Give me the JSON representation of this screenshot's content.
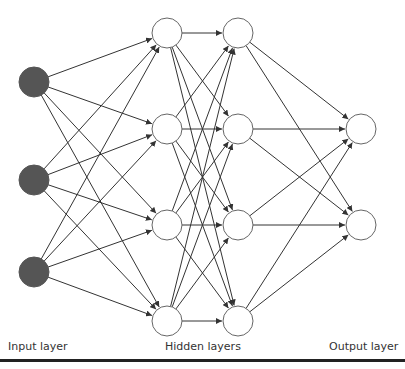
{
  "labels": {
    "input": "Input layer",
    "hidden": "Hidden layers",
    "output": "Output layer"
  },
  "colors": {
    "input_fill": "#555555",
    "node_fill": "#ffffff",
    "node_stroke": "#666666",
    "edge": "#333333",
    "rule": "#222222"
  },
  "node_radius": 15,
  "layers": [
    {
      "name": "input",
      "x": 34,
      "ys": [
        82,
        180,
        272
      ],
      "filled": true
    },
    {
      "name": "hidden1",
      "x": 167,
      "ys": [
        33,
        129,
        225,
        321
      ],
      "filled": false
    },
    {
      "name": "hidden2",
      "x": 238,
      "ys": [
        33,
        129,
        225,
        321
      ],
      "filled": false
    },
    {
      "name": "output",
      "x": 361,
      "ys": [
        129,
        225
      ],
      "filled": false
    }
  ],
  "connectivity": "fully-connected between consecutive layers, arrows pointing right"
}
